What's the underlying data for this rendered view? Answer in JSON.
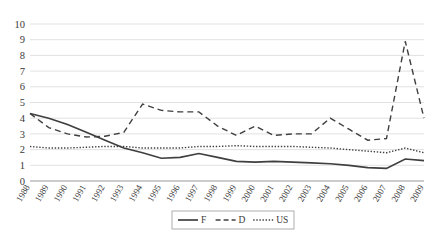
{
  "chart_data": {
    "type": "line",
    "title": "",
    "xlabel": "",
    "ylabel": "",
    "ylim": [
      0,
      10
    ],
    "ytick_values": [
      0,
      1,
      2,
      3,
      4,
      5,
      6,
      7,
      8,
      9,
      10
    ],
    "ytick_labels": [
      "0",
      "1",
      "2",
      "3",
      "4",
      "5",
      "6",
      "7",
      "8",
      "9",
      "10"
    ],
    "grid": true,
    "legend_position": "bottom-center",
    "categories": [
      "1988",
      "1989",
      "1990",
      "1991",
      "1992",
      "1993",
      "1994",
      "1995",
      "1996",
      "1997",
      "1998",
      "1999",
      "2000",
      "2001",
      "2002",
      "2003",
      "2004",
      "2005",
      "2006",
      "2007",
      "2008",
      "2009"
    ],
    "series": [
      {
        "name": "F",
        "style": "solid",
        "color": "#3f3f3f",
        "values": [
          4.3,
          4.0,
          3.6,
          3.1,
          2.6,
          2.1,
          1.8,
          1.45,
          1.5,
          1.75,
          1.5,
          1.25,
          1.2,
          1.25,
          1.2,
          1.15,
          1.1,
          1.0,
          0.85,
          0.8,
          1.4,
          1.3
        ]
      },
      {
        "name": "D",
        "style": "dashed",
        "color": "#3f3f3f",
        "values": [
          4.3,
          3.4,
          3.0,
          2.8,
          2.85,
          3.1,
          4.9,
          4.5,
          4.4,
          4.4,
          3.5,
          2.9,
          3.5,
          2.9,
          3.0,
          3.0,
          4.0,
          3.3,
          2.6,
          2.7,
          8.9,
          4.0
        ]
      },
      {
        "name": "US",
        "style": "dotted",
        "color": "#3f3f3f",
        "values": [
          2.2,
          2.1,
          2.1,
          2.15,
          2.2,
          2.2,
          2.1,
          2.1,
          2.1,
          2.2,
          2.2,
          2.25,
          2.2,
          2.2,
          2.2,
          2.15,
          2.1,
          2.0,
          1.9,
          1.8,
          2.1,
          1.8
        ]
      }
    ],
    "legend": [
      {
        "label": "F",
        "style": "solid"
      },
      {
        "label": "D",
        "style": "dashed"
      },
      {
        "label": "US",
        "style": "dotted"
      }
    ]
  }
}
